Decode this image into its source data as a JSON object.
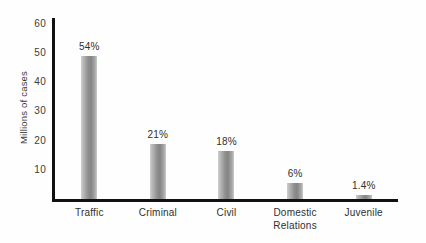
{
  "chart_data": {
    "type": "bar",
    "title": "",
    "subtitle": "",
    "xlabel": "",
    "ylabel": "Millions of cases",
    "ylim": [
      0,
      62
    ],
    "yticks": [
      10,
      20,
      30,
      40,
      50,
      60
    ],
    "ytick_labels": [
      "10",
      "20",
      "30",
      "40",
      "50",
      "60"
    ],
    "grid": false,
    "legend": false,
    "categories": [
      "Traffic",
      "Criminal",
      "Civil",
      "Domestic\nRelations",
      "Juvenile"
    ],
    "values": [
      49.0,
      19.0,
      16.5,
      5.5,
      1.3
    ],
    "data_labels": [
      "54%",
      "21%",
      "18%",
      "6%",
      "1.4%"
    ],
    "bar_color": "#8f8f8f",
    "axis_color": "#111111",
    "text_color": "#2f2f2f",
    "background": "#fefefe"
  }
}
